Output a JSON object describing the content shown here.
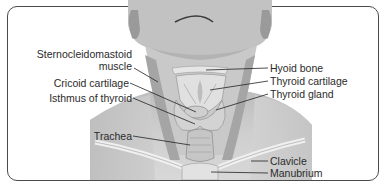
{
  "diagram": {
    "labels_left": [
      {
        "id": "scm",
        "line1": "Sternocleidomastoid",
        "line2": "muscle"
      },
      {
        "id": "cricoid",
        "text": "Cricoid cartilage"
      },
      {
        "id": "isthmus",
        "text": "Isthmus of thyroid"
      },
      {
        "id": "trachea",
        "text": "Trachea"
      }
    ],
    "labels_right": [
      {
        "id": "hyoid",
        "text": "Hyoid bone"
      },
      {
        "id": "thyroid-cartilage",
        "text": "Thyroid cartilage"
      },
      {
        "id": "thyroid-gland",
        "text": "Thyroid gland"
      },
      {
        "id": "clavicle",
        "text": "Clavicle"
      },
      {
        "id": "manubrium",
        "text": "Manubrium"
      }
    ],
    "colors": {
      "frame": "#4a4a4a",
      "text": "#2b2b2b",
      "leader": "#222222",
      "skin_light": "#d9d9d9",
      "skin_mid": "#bdbdbd",
      "skin_dark": "#8f8f8f"
    }
  }
}
